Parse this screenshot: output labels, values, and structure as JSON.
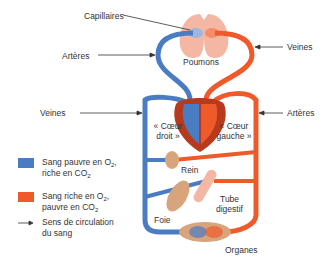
{
  "colors": {
    "deoxygenated": "#4a7cc4",
    "oxygenated": "#ef5a2a",
    "heart_dark": "#b73a1e",
    "lungs": "#f4b7a4",
    "organ_tan": "#d8a47c",
    "text": "#333333"
  },
  "labels": {
    "capillaires": "Capillaires",
    "arteres_top": "Artères",
    "poumons": "Poumons",
    "veines_top": "Veines",
    "veines_left": "Veines",
    "arteres_right": "Artères",
    "coeur_droit_1": "« Cœur",
    "coeur_droit_2": "droit »",
    "coeur_gauche_1": "« Cœur",
    "coeur_gauche_2": "gauche »",
    "rein": "Rein",
    "tube_1": "Tube",
    "tube_2": "digestif",
    "foie": "Foie",
    "organes": "Organes"
  },
  "legend": {
    "items": [
      {
        "line1_pre": "Sang pauvre en O",
        "line1_sub": "2",
        "line1_post": ",",
        "line2_pre": "riche en CO",
        "line2_sub": "2"
      },
      {
        "line1_pre": "Sang riche en O",
        "line1_sub": "2",
        "line1_post": ",",
        "line2_pre": "pauvre en CO",
        "line2_sub": "2"
      },
      {
        "line1": "Sens de circulation",
        "line2": "du sang"
      }
    ]
  }
}
